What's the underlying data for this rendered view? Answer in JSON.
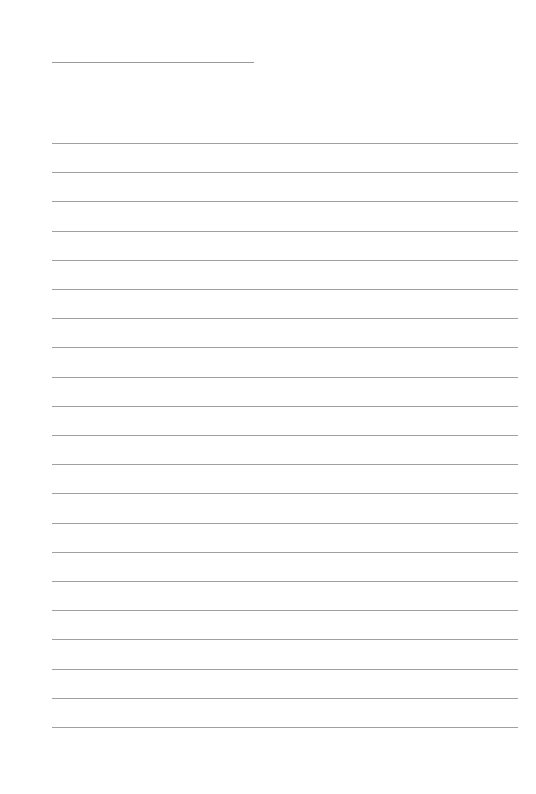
{
  "page": {
    "type": "lined-writing-sheet",
    "background_color": "#ffffff",
    "line_color": "#a0a0a0",
    "title_line": {
      "label": "",
      "length_px": 202
    },
    "ruled_lines": {
      "count": 21,
      "spacing_px": 29.2,
      "first_y_px": 143,
      "last_y_px": 727,
      "entries": [
        "",
        "",
        "",
        "",
        "",
        "",
        "",
        "",
        "",
        "",
        "",
        "",
        "",
        "",
        "",
        "",
        "",
        "",
        "",
        "",
        ""
      ]
    }
  }
}
